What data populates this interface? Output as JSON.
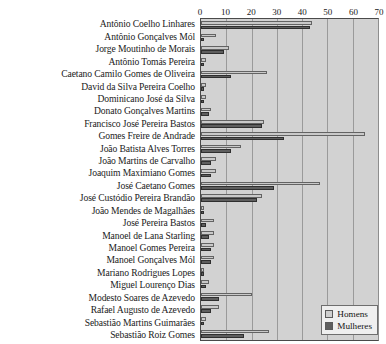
{
  "chart_data": {
    "type": "bar",
    "orientation": "horizontal",
    "title": "",
    "xlabel": "",
    "ylabel": "",
    "xlim": [
      0,
      70
    ],
    "xticks": [
      0,
      10,
      20,
      30,
      40,
      50,
      60,
      70
    ],
    "grid": true,
    "legend_position": "bottom-right",
    "categories": [
      "Antônio Coelho Linhares",
      "Antônio Gonçalves Mól",
      "Jorge Moutinho de Morais",
      "Antônio Tomás Pereira",
      "Caetano Camilo Gomes de Oliveira",
      "David da Silva Pereira Coelho",
      "Dominicano José da Silva",
      "Donato Gonçalves Martins",
      "Francisco José Pereira Bastos",
      "Gomes Freire de Andrade",
      "João Batista Alves Torres",
      "João Martins de Carvalho",
      "Joaquim Maximiano Gomes",
      "José Caetano Gomes",
      "José Custódio Pereira Brandão",
      "João Mendes de Magalhães",
      "José Pereira Bastos",
      "Manoel de Lana Starling",
      "Manoel Gomes Pereira",
      "Manoel Gonçalves Mól",
      "Mariano Rodrigues Lopes",
      "Miguel Lourenço Dias",
      "Modesto Soares de Azevedo",
      "Rafael Augusto de Azevedo",
      "Sebastião Martins Guimarães",
      "Sebastião Roiz Gomes"
    ],
    "series": [
      {
        "name": "Homens",
        "color": "#c9c9c9",
        "values": [
          44,
          6,
          11,
          2,
          26,
          2,
          2,
          4,
          25,
          65,
          16,
          6,
          6,
          47,
          24,
          1,
          5,
          5,
          5,
          5,
          1,
          3,
          20,
          7,
          2,
          27
        ]
      },
      {
        "name": "Mulheres",
        "color": "#5e5e5e",
        "values": [
          43,
          1,
          9,
          1,
          12,
          1,
          1,
          3,
          24,
          33,
          12,
          4,
          4,
          29,
          22,
          1,
          2,
          3,
          4,
          4,
          1,
          2,
          7,
          4,
          1,
          17
        ]
      }
    ]
  },
  "legend": {
    "items": [
      {
        "label": "Homens"
      },
      {
        "label": "Mulheres"
      }
    ]
  }
}
